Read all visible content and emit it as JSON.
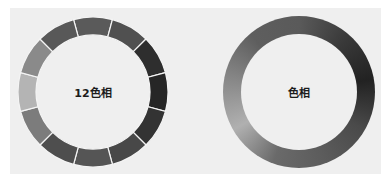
{
  "left_wheel": {
    "label": "12色相",
    "segment_count": 12,
    "segment_colors": [
      "#5a5a5a",
      "#505050",
      "#2e2e2e",
      "#262626",
      "#333333",
      "#484848",
      "#555555",
      "#4e4e4e",
      "#7c7c7c",
      "#b4b4b4",
      "#8a8a8a",
      "#585858"
    ],
    "divider_color": "#f4f4f4"
  },
  "right_wheel": {
    "label": "色相",
    "gradient_stops": [
      "#5a5a5a",
      "#3a3a3a",
      "#222222",
      "#4a4a4a",
      "#5c5c5c",
      "#6a6a6a",
      "#b0b0b0",
      "#888888",
      "#5e5e5e",
      "#5a5a5a"
    ]
  },
  "colors": {
    "panel_background": "#efefef",
    "page_background": "#ffffff",
    "label_text": "#1c1c1c"
  }
}
